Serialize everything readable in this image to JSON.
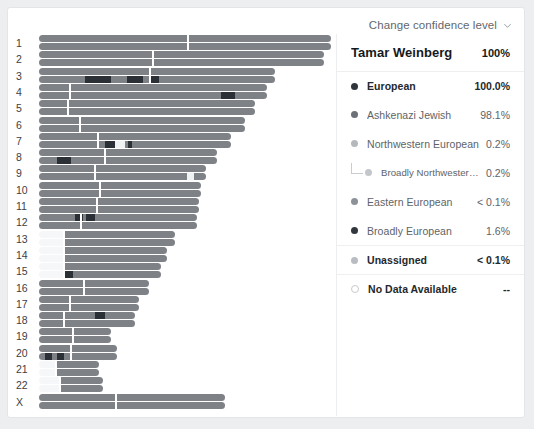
{
  "header": {
    "confidence_label": "Change confidence level",
    "chevron_icon": "chevron-down-icon"
  },
  "panel": {
    "profile_name": "Tamar Weinberg",
    "profile_value": "100%",
    "rows": [
      {
        "label": "European",
        "value": "100.0%",
        "dot": "#2f353b",
        "bold": true,
        "indent": 0,
        "sep": true
      },
      {
        "label": "Ashkenazi Jewish",
        "value": "98.1%",
        "dot": "#6b7177",
        "bold": false,
        "indent": 0,
        "sep": false
      },
      {
        "label": "Northwestern European",
        "value": "0.2%",
        "dot": "#b5b9bd",
        "bold": false,
        "indent": 0,
        "sep": false
      },
      {
        "label": "Broadly Northwestern European",
        "value": "0.2%",
        "dot": "#c3c7cb",
        "bold": false,
        "indent": 1,
        "sep": false
      },
      {
        "label": "Eastern European",
        "value": "< 0.1%",
        "dot": "#8d9298",
        "bold": false,
        "indent": 0,
        "sep": false
      },
      {
        "label": "Broadly European",
        "value": "1.6%",
        "dot": "#31373d",
        "bold": false,
        "indent": 0,
        "sep": false
      },
      {
        "label": "Unassigned",
        "value": "< 0.1%",
        "dot": "#b9bdc1",
        "bold": true,
        "indent": 0,
        "sep": true
      },
      {
        "label": "No Data Available",
        "value": "--",
        "dot": "hollow",
        "bold": true,
        "indent": 0,
        "sep": true
      }
    ]
  },
  "chart_data": {
    "type": "chromosome-painting",
    "xlabel": "",
    "ylabel": "Chromosome",
    "colors": {
      "assigned": "#7e8287",
      "dark": "#2b3036",
      "unassigned": "#f0f1f2",
      "nodata": "#f6f7f8",
      "centromere": "#ffffff"
    },
    "legend_position": "right",
    "axis_max_px": 292,
    "categories": [
      "1",
      "2",
      "3",
      "4",
      "5",
      "6",
      "7",
      "8",
      "9",
      "10",
      "11",
      "12",
      "13",
      "14",
      "15",
      "16",
      "17",
      "18",
      "19",
      "20",
      "21",
      "22",
      "X"
    ],
    "chromosomes": [
      {
        "name": "1",
        "start": 0,
        "end": 292,
        "cent": 148,
        "hapA": [
          {
            "s": 0,
            "e": 292,
            "c": "assigned"
          }
        ],
        "hapB": [
          {
            "s": 0,
            "e": 292,
            "c": "assigned"
          }
        ]
      },
      {
        "name": "2",
        "start": 0,
        "end": 285,
        "cent": 113,
        "hapA": [
          {
            "s": 0,
            "e": 285,
            "c": "assigned"
          }
        ],
        "hapB": [
          {
            "s": 0,
            "e": 285,
            "c": "assigned"
          }
        ]
      },
      {
        "name": "3",
        "start": 0,
        "end": 236,
        "cent": 110,
        "hapA": [
          {
            "s": 0,
            "e": 236,
            "c": "assigned"
          }
        ],
        "hapB": [
          {
            "s": 0,
            "e": 236,
            "c": "assigned"
          },
          {
            "s": 46,
            "e": 72,
            "c": "dark"
          },
          {
            "s": 88,
            "e": 104,
            "c": "dark"
          },
          {
            "s": 110,
            "e": 120,
            "c": "dark"
          }
        ]
      },
      {
        "name": "4",
        "start": 0,
        "end": 228,
        "cent": 30,
        "hapA": [
          {
            "s": 0,
            "e": 228,
            "c": "assigned"
          }
        ],
        "hapB": [
          {
            "s": 0,
            "e": 228,
            "c": "assigned"
          },
          {
            "s": 182,
            "e": 196,
            "c": "dark"
          }
        ]
      },
      {
        "name": "5",
        "start": 0,
        "end": 216,
        "cent": 28,
        "hapA": [
          {
            "s": 0,
            "e": 216,
            "c": "assigned"
          }
        ],
        "hapB": [
          {
            "s": 0,
            "e": 216,
            "c": "assigned"
          }
        ]
      },
      {
        "name": "6",
        "start": 0,
        "end": 206,
        "cent": 40,
        "hapA": [
          {
            "s": 0,
            "e": 206,
            "c": "assigned"
          }
        ],
        "hapB": [
          {
            "s": 0,
            "e": 206,
            "c": "assigned"
          }
        ]
      },
      {
        "name": "7",
        "start": 0,
        "end": 192,
        "cent": 58,
        "hapA": [
          {
            "s": 0,
            "e": 192,
            "c": "assigned"
          }
        ],
        "hapB": [
          {
            "s": 0,
            "e": 192,
            "c": "assigned"
          },
          {
            "s": 66,
            "e": 76,
            "c": "dark"
          },
          {
            "s": 76,
            "e": 86,
            "c": "unassigned"
          },
          {
            "s": 89,
            "e": 93,
            "c": "dark"
          }
        ]
      },
      {
        "name": "8",
        "start": 0,
        "end": 178,
        "cent": 65,
        "hapA": [
          {
            "s": 0,
            "e": 178,
            "c": "assigned"
          }
        ],
        "hapB": [
          {
            "s": 0,
            "e": 178,
            "c": "assigned"
          },
          {
            "s": 18,
            "e": 32,
            "c": "dark"
          }
        ]
      },
      {
        "name": "9",
        "start": 0,
        "end": 167,
        "cent": 55,
        "hapA": [
          {
            "s": 0,
            "e": 167,
            "c": "assigned"
          }
        ],
        "hapB": [
          {
            "s": 0,
            "e": 167,
            "c": "assigned"
          },
          {
            "s": 148,
            "e": 155,
            "c": "unassigned"
          }
        ]
      },
      {
        "name": "10",
        "start": 0,
        "end": 162,
        "cent": 60,
        "hapA": [
          {
            "s": 0,
            "e": 162,
            "c": "assigned"
          }
        ],
        "hapB": [
          {
            "s": 0,
            "e": 162,
            "c": "assigned"
          }
        ]
      },
      {
        "name": "11",
        "start": 0,
        "end": 160,
        "cent": 57,
        "hapA": [
          {
            "s": 0,
            "e": 160,
            "c": "assigned"
          }
        ],
        "hapB": [
          {
            "s": 0,
            "e": 160,
            "c": "assigned"
          }
        ]
      },
      {
        "name": "12",
        "start": 0,
        "end": 158,
        "cent": 41,
        "hapA": [
          {
            "s": 0,
            "e": 158,
            "c": "assigned"
          },
          {
            "s": 36,
            "e": 44,
            "c": "dark"
          },
          {
            "s": 47,
            "e": 56,
            "c": "dark"
          }
        ],
        "hapB": [
          {
            "s": 0,
            "e": 158,
            "c": "assigned"
          }
        ]
      },
      {
        "name": "13",
        "start": 0,
        "end": 136,
        "cent": 24,
        "hapA": [
          {
            "s": 0,
            "e": 24,
            "c": "nodata"
          },
          {
            "s": 24,
            "e": 136,
            "c": "assigned"
          }
        ],
        "hapB": [
          {
            "s": 0,
            "e": 24,
            "c": "nodata"
          },
          {
            "s": 24,
            "e": 136,
            "c": "assigned"
          }
        ]
      },
      {
        "name": "14",
        "start": 0,
        "end": 128,
        "cent": 24,
        "hapA": [
          {
            "s": 0,
            "e": 24,
            "c": "nodata"
          },
          {
            "s": 24,
            "e": 128,
            "c": "assigned"
          }
        ],
        "hapB": [
          {
            "s": 0,
            "e": 24,
            "c": "nodata"
          },
          {
            "s": 24,
            "e": 128,
            "c": "assigned"
          }
        ]
      },
      {
        "name": "15",
        "start": 0,
        "end": 122,
        "cent": 24,
        "hapA": [
          {
            "s": 0,
            "e": 24,
            "c": "nodata"
          },
          {
            "s": 24,
            "e": 122,
            "c": "assigned"
          }
        ],
        "hapB": [
          {
            "s": 0,
            "e": 24,
            "c": "nodata"
          },
          {
            "s": 24,
            "e": 122,
            "c": "assigned"
          },
          {
            "s": 25,
            "e": 34,
            "c": "dark"
          }
        ]
      },
      {
        "name": "16",
        "start": 0,
        "end": 110,
        "cent": 44,
        "hapA": [
          {
            "s": 0,
            "e": 110,
            "c": "assigned"
          }
        ],
        "hapB": [
          {
            "s": 0,
            "e": 110,
            "c": "assigned"
          }
        ]
      },
      {
        "name": "17",
        "start": 0,
        "end": 100,
        "cent": 30,
        "hapA": [
          {
            "s": 0,
            "e": 100,
            "c": "assigned"
          }
        ],
        "hapB": [
          {
            "s": 0,
            "e": 100,
            "c": "assigned"
          }
        ]
      },
      {
        "name": "18",
        "start": 0,
        "end": 96,
        "cent": 24,
        "hapA": [
          {
            "s": 0,
            "e": 96,
            "c": "assigned"
          },
          {
            "s": 56,
            "e": 66,
            "c": "dark"
          }
        ],
        "hapB": [
          {
            "s": 0,
            "e": 96,
            "c": "assigned"
          }
        ]
      },
      {
        "name": "19",
        "start": 0,
        "end": 72,
        "cent": 33,
        "hapA": [
          {
            "s": 0,
            "e": 72,
            "c": "assigned"
          }
        ],
        "hapB": [
          {
            "s": 0,
            "e": 72,
            "c": "assigned"
          }
        ]
      },
      {
        "name": "20",
        "start": 0,
        "end": 78,
        "cent": 31,
        "hapA": [
          {
            "s": 0,
            "e": 78,
            "c": "assigned"
          }
        ],
        "hapB": [
          {
            "s": 0,
            "e": 78,
            "c": "assigned"
          },
          {
            "s": 6,
            "e": 13,
            "c": "dark"
          },
          {
            "s": 18,
            "e": 25,
            "c": "dark"
          }
        ]
      },
      {
        "name": "21",
        "start": 0,
        "end": 60,
        "cent": 16,
        "hapA": [
          {
            "s": 0,
            "e": 16,
            "c": "nodata"
          },
          {
            "s": 16,
            "e": 60,
            "c": "assigned"
          }
        ],
        "hapB": [
          {
            "s": 0,
            "e": 16,
            "c": "nodata"
          },
          {
            "s": 16,
            "e": 60,
            "c": "assigned"
          }
        ]
      },
      {
        "name": "22",
        "start": 0,
        "end": 64,
        "cent": 20,
        "hapA": [
          {
            "s": 0,
            "e": 20,
            "c": "nodata"
          },
          {
            "s": 20,
            "e": 64,
            "c": "assigned"
          }
        ],
        "hapB": [
          {
            "s": 0,
            "e": 20,
            "c": "nodata"
          },
          {
            "s": 20,
            "e": 64,
            "c": "assigned"
          }
        ]
      },
      {
        "name": "X",
        "start": 0,
        "end": 186,
        "cent": 76,
        "hapA": [
          {
            "s": 0,
            "e": 186,
            "c": "assigned"
          }
        ],
        "hapB": [
          {
            "s": 0,
            "e": 186,
            "c": "assigned"
          }
        ]
      }
    ]
  }
}
